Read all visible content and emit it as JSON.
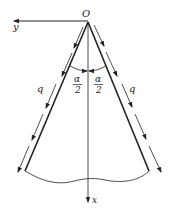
{
  "diagram": {
    "type": "wedge-with-surface-shear",
    "labels": {
      "origin": "O",
      "y_axis": "y",
      "x_axis": "x",
      "load_left": "q",
      "load_right": "q",
      "half_angle_left_num": "α",
      "half_angle_left_den": "2",
      "half_angle_right_num": "α",
      "half_angle_right_den": "2"
    },
    "colors": {
      "stroke": "#222222",
      "background": "#ffffff"
    }
  }
}
